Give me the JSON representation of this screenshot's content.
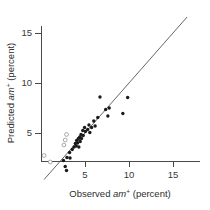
{
  "chart_data": {
    "type": "scatter",
    "title": "",
    "xlabel": "Observed am+ (percent)",
    "ylabel": "Predicted am+ (percent)",
    "xlabel_parts": {
      "lead": "Observed ",
      "italic": "am",
      "sup": "+",
      "trail": " (percent)"
    },
    "ylabel_parts": {
      "lead": "Predicted ",
      "italic": "am",
      "sup": "+",
      "trail": " (percent)"
    },
    "xlim": [
      0,
      17.5
    ],
    "ylim": [
      0,
      17.5
    ],
    "xticks": [
      5,
      10,
      15
    ],
    "yticks": [
      5,
      10,
      15
    ],
    "xticklabels": [
      "5",
      "10",
      "15"
    ],
    "yticklabels": [
      "5",
      "10",
      "15"
    ],
    "grid": false,
    "legend": "none",
    "reference_line": {
      "name": "one-to-one-line",
      "type": "identity",
      "slope": 1,
      "intercept": 0,
      "x_start": 0.35,
      "x_end": 16.6
    },
    "series": [
      {
        "name": "filled-points",
        "marker": "filled-circle",
        "color": "#1a1a1a",
        "points": [
          [
            2.55,
            2.25
          ],
          [
            2.75,
            1.65
          ],
          [
            2.9,
            1.25
          ],
          [
            2.95,
            2.55
          ],
          [
            3.25,
            3.05
          ],
          [
            3.3,
            2.5
          ],
          [
            3.55,
            3.35
          ],
          [
            3.75,
            3.6
          ],
          [
            3.9,
            3.95
          ],
          [
            4.0,
            3.7
          ],
          [
            4.05,
            4.25
          ],
          [
            4.15,
            4.0
          ],
          [
            4.25,
            4.45
          ],
          [
            4.3,
            3.6
          ],
          [
            4.4,
            4.6
          ],
          [
            4.45,
            4.15
          ],
          [
            4.55,
            4.85
          ],
          [
            4.6,
            4.45
          ],
          [
            4.75,
            5.25
          ],
          [
            4.8,
            4.75
          ],
          [
            4.95,
            5.55
          ],
          [
            5.05,
            5.15
          ],
          [
            5.3,
            5.35
          ],
          [
            5.45,
            5.8
          ],
          [
            5.55,
            5.05
          ],
          [
            5.75,
            5.55
          ],
          [
            6.0,
            6.2
          ],
          [
            6.15,
            5.7
          ],
          [
            6.45,
            6.55
          ],
          [
            6.7,
            8.6
          ],
          [
            7.35,
            7.35
          ],
          [
            7.6,
            6.7
          ],
          [
            7.75,
            7.5
          ],
          [
            9.3,
            6.95
          ],
          [
            9.85,
            8.55
          ]
        ]
      },
      {
        "name": "open-points",
        "marker": "open-circle",
        "color": "#8d8d92",
        "points": [
          [
            0.35,
            2.75
          ],
          [
            1.05,
            2.1
          ],
          [
            2.6,
            3.8
          ],
          [
            2.75,
            4.3
          ],
          [
            2.9,
            4.85
          ]
        ]
      }
    ]
  },
  "colors": {
    "axis": "#4a4a4a",
    "reference_line": "#55555a",
    "filled_marker": "#1a1a1a",
    "open_marker_stroke": "#8d8d92",
    "background": "#ffffff"
  }
}
